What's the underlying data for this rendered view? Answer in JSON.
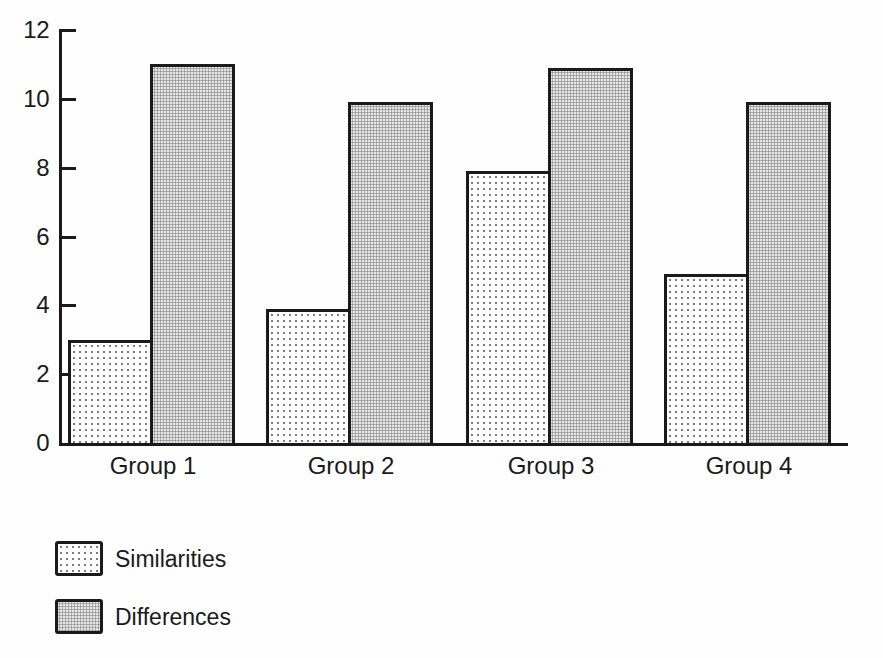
{
  "chart_data": {
    "type": "bar",
    "title": "",
    "xlabel": "",
    "ylabel": "",
    "categories": [
      "Group 1",
      "Group 2",
      "Group 3",
      "Group 4"
    ],
    "series": [
      {
        "name": "Similarities",
        "pattern": "sparse-dots",
        "values": [
          3,
          3.9,
          7.9,
          4.9
        ]
      },
      {
        "name": "Differences",
        "pattern": "dense-halftone",
        "values": [
          11,
          9.9,
          10.9,
          9.9
        ]
      }
    ],
    "ylim": [
      0,
      12
    ],
    "yticks": [
      0,
      2,
      4,
      6,
      8,
      10,
      12
    ],
    "grid": false,
    "legend_position": "bottom-left"
  },
  "colors": {
    "ink": "#1a1a1a",
    "paper": "#fefefe",
    "similarities_bg": "#ffffff",
    "similarities_dot": "#7d7d7d",
    "differences_bg": "#e4e4e4",
    "differences_dot": "#8e8e8e"
  }
}
